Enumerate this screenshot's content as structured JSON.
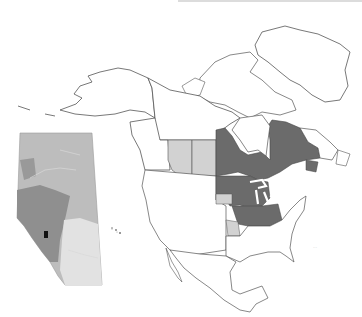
{
  "figure": {
    "title": "",
    "scale_mark": "···"
  },
  "legend": {
    "colors": {
      "present": "#6b6b6b",
      "partial": "#d2d2d2",
      "absent": "#ffffff",
      "outline": "#555555",
      "inset_base": "#bdbdbd",
      "inset_mountain": "#8f8f8f",
      "inset_plain": "#e2e2e2",
      "inset_marker": "#111111"
    }
  },
  "regions": {
    "dark": [
      "Manitoba",
      "Ontario",
      "Quebec",
      "New Brunswick",
      "Minnesota",
      "Wisconsin",
      "Michigan",
      "Iowa",
      "Illinois",
      "Indiana",
      "Ohio"
    ],
    "light": [
      "Alberta",
      "Saskatchewan",
      "South Dakota",
      "Missouri"
    ]
  },
  "inset": {
    "region": "Alberta",
    "marker": "site-location"
  }
}
